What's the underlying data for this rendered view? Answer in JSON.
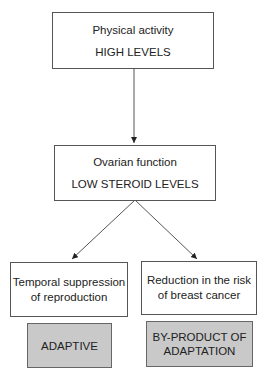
{
  "diagram": {
    "top": {
      "line1": "Physical activity",
      "line2": "HIGH LEVELS"
    },
    "middle": {
      "line1": "Ovarian function",
      "line2": "LOW STEROID LEVELS"
    },
    "left": {
      "line1": "Temporal suppression",
      "line2": "of reproduction"
    },
    "right": {
      "line1": "Reduction in the risk",
      "line2": "of breast cancer"
    },
    "left_outcome": {
      "line1": "ADAPTIVE"
    },
    "right_outcome": {
      "line1": "BY-PRODUCT OF",
      "line2": "ADAPTATION"
    }
  },
  "colors": {
    "outcome_fill": "#c9c9c9",
    "border": "#555555"
  }
}
